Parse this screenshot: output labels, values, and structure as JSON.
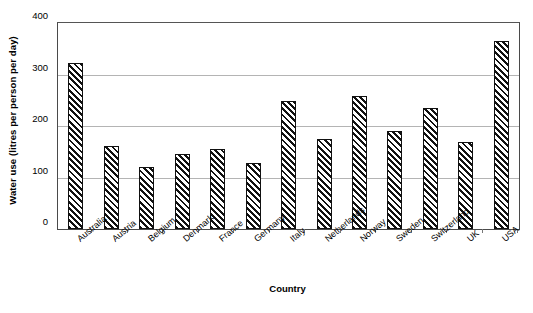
{
  "chart_data": {
    "type": "bar",
    "title": "",
    "xlabel": "Country",
    "ylabel": "Water use (litres per person per day)",
    "categories": [
      "Australia",
      "Austria",
      "Belgium",
      "Denmark",
      "France",
      "Germany",
      "Italy",
      "Netherlands",
      "Norway",
      "Sweden",
      "Switzerland",
      "UK",
      "USA"
    ],
    "values": [
      322,
      162,
      120,
      145,
      156,
      129,
      248,
      175,
      258,
      190,
      235,
      168,
      365
    ],
    "ylim": [
      0,
      400
    ],
    "yticks": [
      0,
      100,
      200,
      300,
      400
    ],
    "ytick_labels": [
      "0",
      "100",
      "200",
      "300",
      "400"
    ],
    "grid": "horizontal",
    "legend": "none",
    "bar_fill": "diagonal-hatch",
    "bar_edge_color": "#111111",
    "gridline_color": "#b4b4b4",
    "axis_color": "#4a4a4a",
    "background_color": "#ffffff"
  },
  "axes": {
    "y_title": "Water use (litres per person per day)",
    "x_title": "Country"
  }
}
